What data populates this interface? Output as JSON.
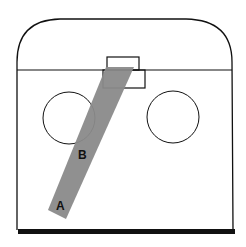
{
  "diagram": {
    "type": "hockey-zone-shot-path",
    "labels": {
      "a": "A",
      "b": "B"
    },
    "colors": {
      "outline": "#111111",
      "path": "#8a8a8a",
      "background": "#ffffff",
      "boards": "#111111"
    }
  }
}
